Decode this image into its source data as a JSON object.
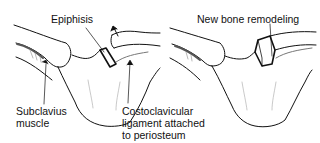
{
  "diagram": {
    "panels": [
      {
        "id": "left",
        "description": "Sternoclavicular joint with displaced epiphysis",
        "labels": {
          "epiphysis": "Epiphisis",
          "subclavius": [
            "Subclavius",
            "muscle"
          ],
          "costoclavicular": [
            "Costoclavicular",
            "ligament attached",
            "to periosteum"
          ]
        }
      },
      {
        "id": "right",
        "description": "Sternoclavicular joint after healing",
        "labels": {
          "remodeling": "New bone remodeling"
        }
      }
    ],
    "colors": {
      "line": "#111111",
      "shade": "#8a8a8a",
      "background": "#ffffff"
    }
  }
}
